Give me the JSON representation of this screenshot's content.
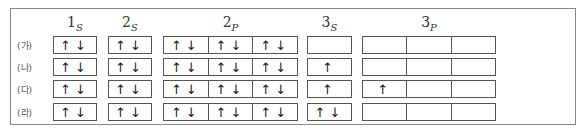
{
  "orbitals": [
    {
      "id": "1s",
      "main": "1",
      "sub": "S",
      "cells": 1
    },
    {
      "id": "2s",
      "main": "2",
      "sub": "S",
      "cells": 1
    },
    {
      "id": "2p",
      "main": "2",
      "sub": "P",
      "cells": 3
    },
    {
      "id": "3s",
      "main": "3",
      "sub": "S",
      "cells": 1
    },
    {
      "id": "3p",
      "main": "3",
      "sub": "P",
      "cells": 3
    }
  ],
  "rows": [
    {
      "label": "(가)",
      "cells": {
        "1s": [
          "↑↓"
        ],
        "2s": [
          "↑↓"
        ],
        "2p": [
          "↑↓",
          "↑↓",
          "↑↓"
        ],
        "3s": [
          ""
        ],
        "3p": [
          "",
          "",
          ""
        ]
      }
    },
    {
      "label": "(나)",
      "cells": {
        "1s": [
          "↑↓"
        ],
        "2s": [
          "↑↓"
        ],
        "2p": [
          "↑↓",
          "↑↓",
          "↑↓"
        ],
        "3s": [
          "↑"
        ],
        "3p": [
          "",
          "",
          ""
        ]
      }
    },
    {
      "label": "(다)",
      "cells": {
        "1s": [
          "↑↓"
        ],
        "2s": [
          "↑↓"
        ],
        "2p": [
          "↑↓",
          "↑↓",
          "↑↓"
        ],
        "3s": [
          "↑"
        ],
        "3p": [
          "↑",
          "",
          ""
        ]
      }
    },
    {
      "label": "(라)",
      "cells": {
        "1s": [
          "↑↓"
        ],
        "2s": [
          "↑↓"
        ],
        "2p": [
          "↑↓",
          "↑↓",
          "↑↓"
        ],
        "3s": [
          "↑↓"
        ],
        "3p": [
          "",
          "",
          ""
        ]
      }
    }
  ]
}
